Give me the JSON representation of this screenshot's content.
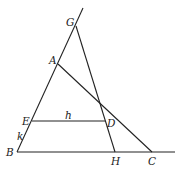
{
  "diagram": {
    "type": "geometry",
    "points": {
      "G": {
        "label": "G",
        "x": 76,
        "y": 26,
        "lx": 66,
        "ly": 26
      },
      "A": {
        "label": "A",
        "x": 58,
        "y": 64,
        "lx": 49,
        "ly": 64
      },
      "E": {
        "label": "E",
        "x": 32,
        "y": 121,
        "lx": 22,
        "ly": 125
      },
      "D": {
        "label": "D",
        "x": 105,
        "y": 121,
        "lx": 107,
        "ly": 127
      },
      "B": {
        "label": "B",
        "x": 17,
        "y": 152,
        "lx": 6,
        "ly": 156
      },
      "H": {
        "label": "H",
        "x": 115,
        "y": 152,
        "lx": 111,
        "ly": 165
      },
      "C": {
        "label": "C",
        "x": 152,
        "y": 152,
        "lx": 148,
        "ly": 165
      }
    },
    "segment_labels": {
      "h": {
        "label": "h",
        "x": 65,
        "y": 119
      },
      "k": {
        "label": "k",
        "x": 17,
        "y": 140
      }
    },
    "lines": [
      {
        "name": "line-BG-extended",
        "x1": 17,
        "y1": 152,
        "x2": 83,
        "y2": 8
      },
      {
        "name": "line-BC-extended",
        "x1": 17,
        "y1": 152,
        "x2": 175,
        "y2": 152
      },
      {
        "name": "segment-GH",
        "x1": 76,
        "y1": 26,
        "x2": 115,
        "y2": 152
      },
      {
        "name": "segment-AC",
        "x1": 58,
        "y1": 64,
        "x2": 152,
        "y2": 152
      },
      {
        "name": "segment-ED",
        "x1": 32,
        "y1": 121,
        "x2": 105,
        "y2": 121
      }
    ]
  }
}
